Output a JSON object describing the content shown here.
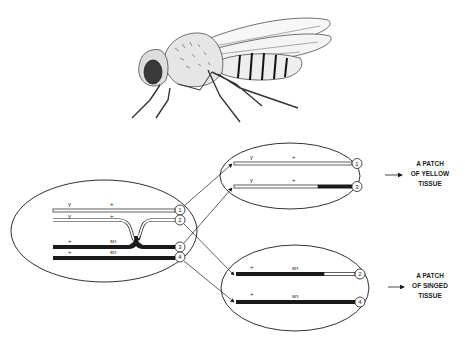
{
  "figure": {
    "colors": {
      "ink": "#1a1a1a",
      "background": "#ffffff",
      "chromatid_light": "#ffffff"
    }
  },
  "parent_cell": {
    "chromatids": [
      {
        "id": "1",
        "marker_left": "y",
        "marker_right": "+",
        "type": "light"
      },
      {
        "id": "2",
        "marker_left": "y",
        "marker_right": "+",
        "type": "light"
      },
      {
        "id": "3",
        "marker_left": "+",
        "marker_right": "sn",
        "type": "dark"
      },
      {
        "id": "4",
        "marker_left": "+",
        "marker_right": "sn",
        "type": "dark"
      }
    ]
  },
  "daughter_cells": [
    {
      "chromatids": [
        {
          "id": "1",
          "marker_left": "y",
          "marker_right": "+",
          "type": "light"
        },
        {
          "id": "3",
          "marker_left": "y",
          "marker_right": "+",
          "type": "light-dark-tip"
        }
      ],
      "result_lines": [
        "A PATCH",
        "OF YELLOW",
        "TISSUE"
      ]
    },
    {
      "chromatids": [
        {
          "id": "2",
          "marker_left": "+",
          "marker_right": "sn",
          "type": "dark-light-tip"
        },
        {
          "id": "4",
          "marker_left": "+",
          "marker_right": "sn",
          "type": "dark"
        }
      ],
      "result_lines": [
        "A PATCH",
        "OF SINGED",
        "TISSUE"
      ]
    }
  ]
}
